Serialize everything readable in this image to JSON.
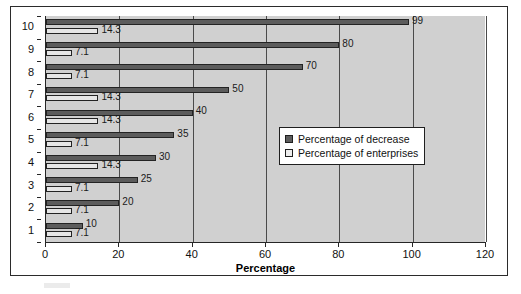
{
  "chart_data": {
    "type": "bar",
    "orientation": "horizontal",
    "title": "",
    "xlabel": "Percentage",
    "ylabel": "",
    "xlim": [
      0,
      120
    ],
    "xticks": [
      0,
      20,
      40,
      60,
      80,
      100,
      120
    ],
    "categories": [
      "1",
      "2",
      "3",
      "4",
      "5",
      "6",
      "7",
      "8",
      "9",
      "10"
    ],
    "grid": true,
    "legend_position": "center-right",
    "series": [
      {
        "name": "Percentage of decrease",
        "color": "#5c5c5c",
        "values": [
          10,
          20,
          25,
          30,
          35,
          40,
          50,
          70,
          80,
          99
        ],
        "labels": [
          "10",
          "20",
          "25",
          "30",
          "35",
          "40",
          "50",
          "70",
          "80",
          "99"
        ]
      },
      {
        "name": "Percentage of enterprises",
        "color": "#e6e6e6",
        "values": [
          7.1,
          7.1,
          7.1,
          14.3,
          7.1,
          14.3,
          14.3,
          7.1,
          7.1,
          14.3
        ],
        "labels": [
          "7.1",
          "7.1",
          "7.1",
          "14.3",
          "7.1",
          "14.3",
          "14.3",
          "7.1",
          "7.1",
          "14.3"
        ]
      }
    ]
  },
  "legend": {
    "items": [
      {
        "label": "Percentage of decrease",
        "swatch": "dark"
      },
      {
        "label": "Percentage of enterprises",
        "swatch": "light"
      }
    ]
  },
  "axis": {
    "x_title": "Percentage",
    "x_tick_labels": [
      "0",
      "20",
      "40",
      "60",
      "80",
      "100",
      "120"
    ],
    "y_tick_labels": [
      "10",
      "9",
      "8",
      "7",
      "6",
      "5",
      "4",
      "3",
      "2",
      "1"
    ]
  },
  "colors": {
    "plot_background": "#d0d0d0",
    "frame_border": "#2b2b2b",
    "gridline": "#4a4a4a",
    "series_dark": "#5c5c5c",
    "series_light": "#e6e6e6",
    "text": "#111111"
  }
}
